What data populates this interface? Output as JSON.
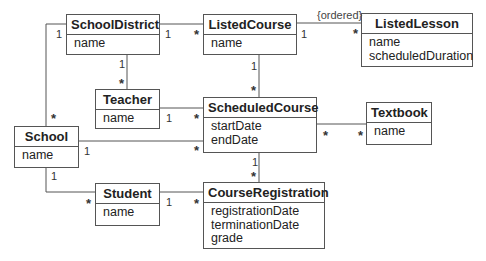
{
  "diagram": {
    "type": "uml-class-diagram",
    "classes": [
      {
        "id": "schooldistrict",
        "name": "SchoolDistrict",
        "attributes": [
          "name"
        ]
      },
      {
        "id": "listedcourse",
        "name": "ListedCourse",
        "attributes": [
          "name"
        ]
      },
      {
        "id": "listedlesson",
        "name": "ListedLesson",
        "attributes": [
          "name",
          "scheduledDuration"
        ]
      },
      {
        "id": "teacher",
        "name": "Teacher",
        "attributes": [
          "name"
        ]
      },
      {
        "id": "scheduledcourse",
        "name": "ScheduledCourse",
        "attributes": [
          "startDate",
          "endDate"
        ]
      },
      {
        "id": "textbook",
        "name": "Textbook",
        "attributes": [
          "name"
        ]
      },
      {
        "id": "school",
        "name": "School",
        "attributes": [
          "name"
        ]
      },
      {
        "id": "student",
        "name": "Student",
        "attributes": [
          "name"
        ]
      },
      {
        "id": "courseregistration",
        "name": "CourseRegistration",
        "attributes": [
          "registrationDate",
          "terminationDate",
          "grade"
        ]
      }
    ],
    "associations": [
      {
        "from": "SchoolDistrict",
        "to": "ListedCourse",
        "from_mult": "1",
        "to_mult": "*"
      },
      {
        "from": "SchoolDistrict",
        "to": "Teacher",
        "from_mult": "1",
        "to_mult": "*"
      },
      {
        "from": "SchoolDistrict",
        "to": "School",
        "from_mult": "1",
        "to_mult": "*"
      },
      {
        "from": "ListedCourse",
        "to": "ListedLesson",
        "from_mult": "1",
        "to_mult": "*",
        "constraint": "{ordered}"
      },
      {
        "from": "ListedCourse",
        "to": "ScheduledCourse",
        "from_mult": "1",
        "to_mult": "*"
      },
      {
        "from": "Teacher",
        "to": "ScheduledCourse",
        "from_mult": "1",
        "to_mult": "*"
      },
      {
        "from": "School",
        "to": "ScheduledCourse",
        "from_mult": "1",
        "to_mult": "*"
      },
      {
        "from": "ScheduledCourse",
        "to": "Textbook",
        "from_mult": "*",
        "to_mult": "*"
      },
      {
        "from": "ScheduledCourse",
        "to": "CourseRegistration",
        "from_mult": "1",
        "to_mult": "*"
      },
      {
        "from": "School",
        "to": "Student",
        "from_mult": "1",
        "to_mult": "*"
      },
      {
        "from": "Student",
        "to": "CourseRegistration",
        "from_mult": "1",
        "to_mult": "*"
      }
    ],
    "labels": {
      "one": "1",
      "many": "*",
      "ordered": "{ordered}"
    }
  }
}
